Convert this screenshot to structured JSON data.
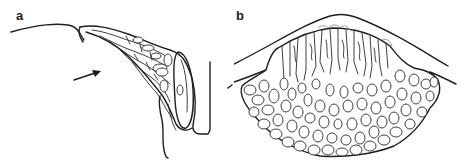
{
  "figure": {
    "panels": [
      {
        "id": "a",
        "label": "a",
        "description": "Line drawing of a tissue fold with elongated cells and an arrow pointing toward it"
      },
      {
        "id": "b",
        "label": "b",
        "description": "Line drawing of a dome-shaped mass of cells beneath a curved surface: elongated columnar cells above, rounded polygonal cells below"
      }
    ],
    "colors": {
      "line": "#1e1e1e",
      "background": "#ffffff"
    }
  }
}
